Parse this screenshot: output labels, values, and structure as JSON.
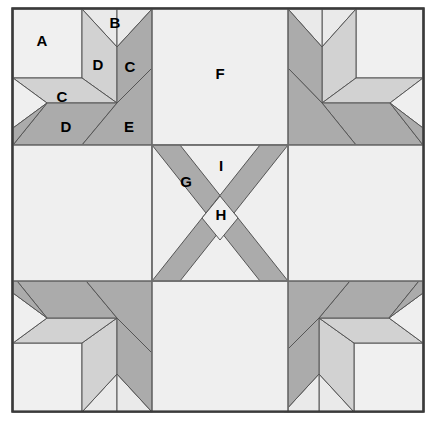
{
  "diagram": {
    "type": "quilt-block-patch-diagram",
    "canvas": {
      "width": 436,
      "height": 425
    },
    "frame": {
      "x": 12,
      "y": 8,
      "width": 412,
      "height": 404,
      "stroke_color": "#3a3a3a",
      "fill_color": "#f2f2f2"
    },
    "grid": {
      "columns": 3,
      "rows": 3,
      "vertical_lines": [
        152,
        288
      ],
      "horizontal_lines": [
        145,
        281
      ],
      "line_color": "#6e6e6e"
    },
    "colors": {
      "background": "#ffffff",
      "light": "#eeeeee",
      "light_2": "#e4e4e4",
      "medium": "#cccccc",
      "dark": "#a8a8a8",
      "outline": "#4a4a4a",
      "frame_stroke": "#3a3a3a",
      "label_text": "#000000"
    },
    "labels": [
      {
        "id": "A",
        "text": "A",
        "x": 42,
        "y": 42,
        "patch": "corner-square",
        "shade": "light"
      },
      {
        "id": "B",
        "text": "B",
        "x": 115,
        "y": 24,
        "patch": "point-triangle",
        "shade": "light"
      },
      {
        "id": "D1",
        "text": "D",
        "x": 98,
        "y": 66,
        "patch": "left-diamond-upper",
        "shade": "medium"
      },
      {
        "id": "C1",
        "text": "C",
        "x": 130,
        "y": 68,
        "patch": "right-diamond-upper",
        "shade": "dark"
      },
      {
        "id": "C2",
        "text": "C",
        "x": 62,
        "y": 98,
        "patch": "left-diamond-lower",
        "shade": "medium"
      },
      {
        "id": "D2",
        "text": "D",
        "x": 66,
        "y": 128,
        "patch": "lower-diamond",
        "shade": "dark"
      },
      {
        "id": "E",
        "text": "E",
        "x": 129,
        "y": 128,
        "patch": "inner-diamond",
        "shade": "dark"
      },
      {
        "id": "F",
        "text": "F",
        "x": 220,
        "y": 75,
        "patch": "plain-square",
        "shade": "light"
      },
      {
        "id": "G",
        "text": "G",
        "x": 186,
        "y": 183,
        "patch": "x-bar-left",
        "shade": "dark"
      },
      {
        "id": "I",
        "text": "I",
        "x": 221,
        "y": 167,
        "patch": "center-background",
        "shade": "light"
      },
      {
        "id": "H",
        "text": "H",
        "x": 221,
        "y": 216,
        "patch": "x-crossing",
        "shade": "light"
      }
    ],
    "legend": {
      "piece_ids": [
        "A",
        "B",
        "C",
        "D",
        "E",
        "F",
        "G",
        "H",
        "I"
      ],
      "piece_count": 9
    }
  }
}
